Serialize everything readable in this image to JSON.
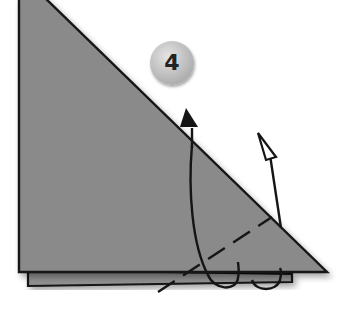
{
  "diagram": {
    "type": "origami-fold-instruction",
    "step": {
      "number": "4"
    },
    "colors": {
      "paper": "#8a8a8a",
      "paper_back_layer": "#909090",
      "outline": "#151515",
      "badge": "#b8b8b8",
      "background": "#ffffff"
    },
    "elements": [
      {
        "name": "paper-front-triangle",
        "kind": "right-triangle",
        "points": [
          [
            19,
            0
          ],
          [
            45,
            0
          ],
          [
            327,
            272
          ],
          [
            19,
            272
          ]
        ]
      },
      {
        "name": "paper-back-layer",
        "kind": "offset-layer",
        "points": [
          [
            28,
            276
          ],
          [
            290,
            283
          ],
          [
            28,
            285
          ]
        ]
      },
      {
        "name": "fold-line",
        "kind": "valley-fold-dashed",
        "from": [
          160,
          292
        ],
        "to": [
          272,
          217
        ]
      },
      {
        "name": "fold-arrow-tall",
        "kind": "curved-arrow-filled-head",
        "head_at": [
          186,
          108
        ]
      },
      {
        "name": "fold-arrow-short",
        "kind": "curved-arrow-hollow-head",
        "head_at": [
          258,
          133
        ]
      }
    ]
  }
}
